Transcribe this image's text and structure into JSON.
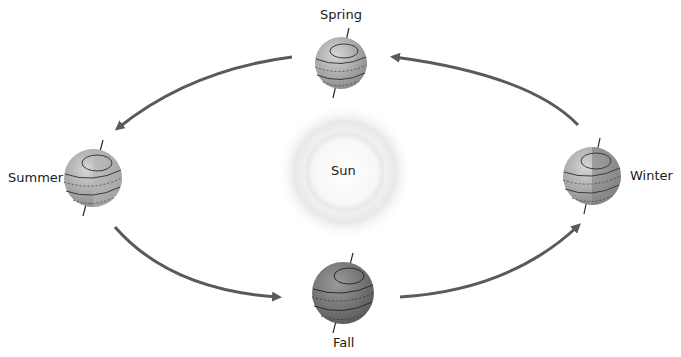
{
  "diagram": {
    "center": {
      "label": "Sun"
    },
    "positions": [
      {
        "id": "spring",
        "label": "Spring"
      },
      {
        "id": "summer",
        "label": "Summer"
      },
      {
        "id": "fall",
        "label": "Fall"
      },
      {
        "id": "winter",
        "label": "Winter"
      }
    ],
    "flow_direction": "counter-clockwise: Winter → Spring → Summer → Fall → Winter",
    "colors": {
      "arrow": "#5a5a5a",
      "globe_light": "#b8b8b8",
      "globe_dark": "#7c7c7c",
      "globe_line": "#3a3a3a",
      "sun_glow": "#e6e6e6"
    }
  }
}
